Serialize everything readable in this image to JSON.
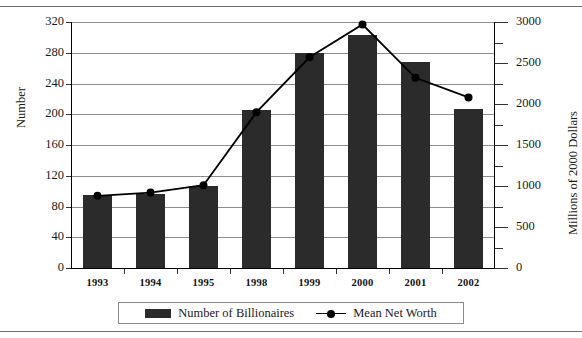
{
  "chart_data": {
    "type": "bar",
    "title": "",
    "subtitle": "",
    "categories": [
      "1993",
      "1994",
      "1995",
      "1998",
      "1999",
      "2000",
      "2001",
      "2002"
    ],
    "series": [
      {
        "name": "Number of Billionaires",
        "type": "bar",
        "axis": "left",
        "values": [
          95,
          96,
          107,
          205,
          280,
          303,
          268,
          207
        ]
      },
      {
        "name": "Mean Net Worth",
        "type": "line",
        "axis": "right",
        "values": [
          880,
          920,
          1010,
          1900,
          2570,
          2970,
          2320,
          2080
        ]
      }
    ],
    "xlabel": "",
    "ylabel": "Number",
    "ylabel_right": "Millions of 2000 Dollars",
    "ylim": [
      0,
      320
    ],
    "yticks": [
      0,
      40,
      80,
      120,
      160,
      200,
      240,
      280,
      320
    ],
    "ylim_right": [
      0,
      3000
    ],
    "yticks_right": [
      0,
      500,
      1000,
      1500,
      2000,
      2500,
      3000
    ],
    "yticks_right_minor": [
      250,
      750,
      1250,
      1750,
      2250,
      2750
    ],
    "grid": true,
    "legend_position": "bottom",
    "legend": [
      "Number of Billionaires",
      "Mean Net Worth"
    ],
    "colors": {
      "bar": "#2b2b2b",
      "line": "#000000",
      "grid": "#8d8d8d",
      "axis": "#000000",
      "background": "#ffffff"
    }
  },
  "axes": {
    "left_title": "Number",
    "right_title": "Millions of 2000 Dollars"
  },
  "legend": {
    "bar_label": "Number of Billionaires",
    "line_label": "Mean Net Worth"
  }
}
